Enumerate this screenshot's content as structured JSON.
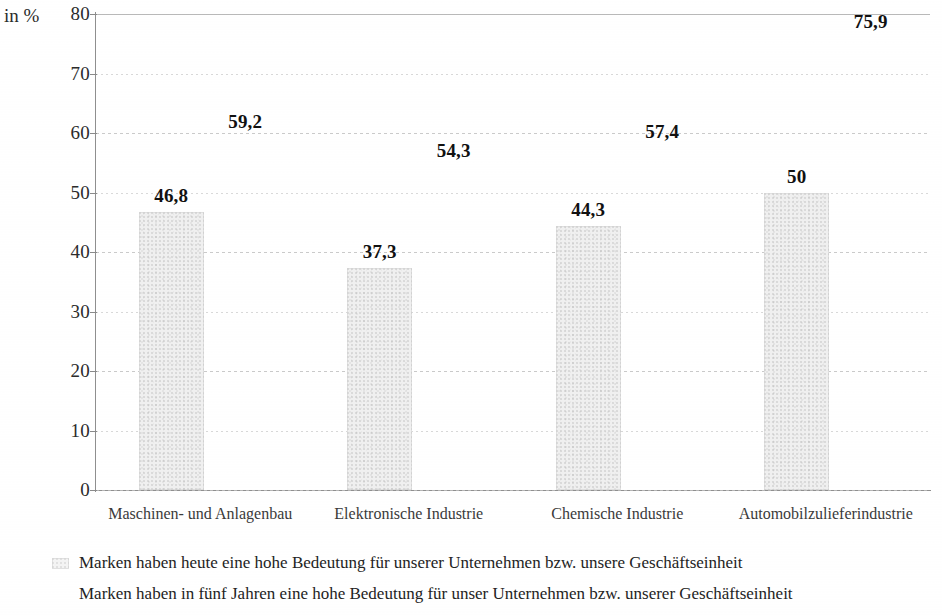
{
  "chart_data": {
    "type": "bar",
    "title": "",
    "subtitle": "",
    "xlabel": "",
    "ylabel": "in %",
    "ylim": [
      0,
      80
    ],
    "ytick_step": 10,
    "yticks": [
      "0",
      "10",
      "20",
      "30",
      "40",
      "50",
      "60",
      "70",
      "80"
    ],
    "grid": true,
    "grid_axis": "y",
    "legend_position": "below",
    "categories": [
      "Maschinen- und Anlagenbau",
      "Elektronische Industrie",
      "Chemische Industrie",
      "Automobilzulieferindustrie"
    ],
    "series": [
      {
        "name": "Marken haben heute eine hohe Bedeutung für unserer Unternehmen bzw. unsere Geschäftseinheit",
        "values": [
          46.8,
          37.3,
          44.3,
          50
        ],
        "value_labels": [
          "46,8",
          "37,3",
          "44,3",
          "50"
        ],
        "rendered_as": "bar"
      },
      {
        "name": "Marken haben in fünf Jahren eine hohe Bedeutung für unser Unternehmen bzw. unserer Geschäftseinheit",
        "values": [
          59.2,
          54.3,
          57.4,
          75.9
        ],
        "value_labels": [
          "59,2",
          "54,3",
          "57,4",
          "75,9"
        ],
        "rendered_as": "label-only"
      }
    ],
    "colors": {
      "bar_fill": "#f0f0f0",
      "bar_edge": "#cdcdcd",
      "gridline": "#cfcfcf",
      "axis": "#8f8f8f",
      "text": "#1a1a1a",
      "background": "#ffffff"
    }
  },
  "axis": {
    "unit_label": "in %"
  },
  "legend": {
    "entries": [
      {
        "label": "Marken haben heute eine hohe Bedeutung für unserer Unternehmen bzw. unsere Geschäftseinheit"
      },
      {
        "label": "Marken haben in fünf Jahren eine hohe Bedeutung für unser Unternehmen bzw. unserer Geschäftseinheit"
      }
    ]
  }
}
